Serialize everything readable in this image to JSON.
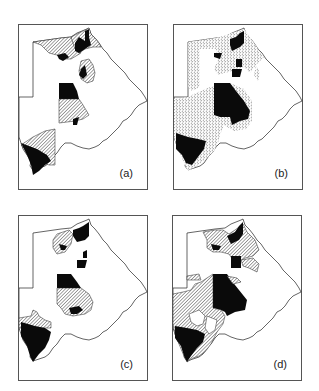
{
  "figure": {
    "panels": [
      {
        "id": "a",
        "label": "(a)",
        "fill_styles": [
          "hatched",
          "black"
        ]
      },
      {
        "id": "b",
        "label": "(b)",
        "fill_styles": [
          "stippled",
          "black"
        ]
      },
      {
        "id": "c",
        "label": "(c)",
        "fill_styles": [
          "hatched",
          "black"
        ]
      },
      {
        "id": "d",
        "label": "(d)",
        "fill_styles": [
          "hatched",
          "black"
        ]
      }
    ]
  },
  "colors": {
    "outline": "#222222",
    "black_fill": "#0a0a0a",
    "frame": "#555555"
  }
}
